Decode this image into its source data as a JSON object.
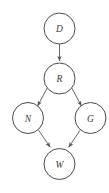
{
  "diagram": {
    "type": "directed-acyclic-graph",
    "title": "",
    "background_color": "#ffffff",
    "node_fill_color": "#ffffff",
    "node_stroke_color": "#4a4a4a",
    "edge_color": "#555555",
    "label_color": "#3a3a3a",
    "nodes": [
      {
        "id": "D",
        "label": "D",
        "cx": 59.5,
        "cy": 28.5,
        "r": 15.5
      },
      {
        "id": "R",
        "label": "R",
        "cx": 59.5,
        "cy": 78.5,
        "r": 15.5
      },
      {
        "id": "N",
        "label": "N",
        "cx": 28.0,
        "cy": 118.0,
        "r": 15.5
      },
      {
        "id": "G",
        "label": "G",
        "cx": 90.5,
        "cy": 118.0,
        "r": 15.5
      },
      {
        "id": "W",
        "label": "W",
        "cx": 59.5,
        "cy": 164.0,
        "r": 15.5
      }
    ],
    "edges": [
      {
        "from": "D",
        "to": "R",
        "arrow": true
      },
      {
        "from": "R",
        "to": "N",
        "arrow": true
      },
      {
        "from": "R",
        "to": "G",
        "arrow": true
      },
      {
        "from": "N",
        "to": "W",
        "arrow": true
      },
      {
        "from": "G",
        "to": "W",
        "arrow": true
      }
    ]
  }
}
